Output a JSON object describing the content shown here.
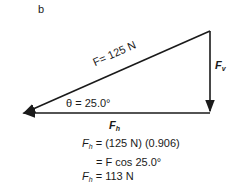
{
  "panel_label": "b",
  "diagram": {
    "hypotenuse_label": "F= 125 N",
    "vertical_label": "F",
    "vertical_sub": "v",
    "angle_label": "θ = 25.0°",
    "horizontal_label": "F",
    "horizontal_sub": "h"
  },
  "equations": [
    {
      "lhs": "F",
      "sub": "h",
      "rhs": " = (125 N) (0.906)"
    },
    {
      "lhs": "",
      "sub": "",
      "rhs": "= F cos 25.0°"
    },
    {
      "lhs": "F",
      "sub": "h",
      "rhs": " = 113 N"
    }
  ],
  "colors": {
    "line": "#1a1a1a",
    "background": "#ffffff"
  }
}
